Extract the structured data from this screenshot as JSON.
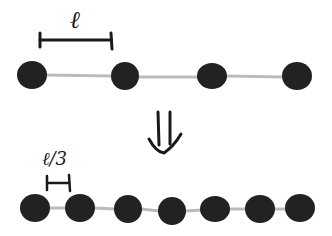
{
  "diagram": {
    "colors": {
      "bead": "#222222",
      "link": "#bbbbbb",
      "ink": "#1a1a1a",
      "background": "#ffffff"
    },
    "top_chain": {
      "spacing_label": "ℓ",
      "bead_count": 4,
      "bead_x": [
        32,
        125,
        212,
        297
      ],
      "y": 75,
      "radius": 14
    },
    "arrow": {
      "glyph": "⇓",
      "meaning": "transforms into"
    },
    "bottom_chain": {
      "spacing_label": "ℓ/3",
      "bead_count": 7,
      "bead_x": [
        35,
        80,
        128,
        172,
        215,
        260,
        300
      ],
      "y": 209,
      "radius": 14
    }
  }
}
